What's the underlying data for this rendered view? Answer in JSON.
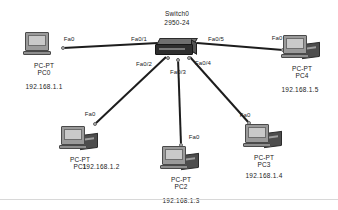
{
  "diagram": {
    "type": "network-topology",
    "tool": "packet-tracer",
    "switch": {
      "name": "Switch0",
      "model": "2950-24",
      "x": 177,
      "y": 47
    },
    "devices": [
      {
        "id": "pc0",
        "type": "PC-PT",
        "name": "PC0",
        "ip": "192.168.1.1",
        "port": "Fa0",
        "switch_port": "Fa0/1",
        "x": 44,
        "y": 46,
        "icon": "pc-icon"
      },
      {
        "id": "pc1",
        "type": "PC-PT",
        "name": "PC1",
        "ip": "192.168.1.2",
        "port": "Fa0",
        "switch_port": "Fa0/2",
        "x": 80,
        "y": 140,
        "icon": "pc-icon"
      },
      {
        "id": "pc2",
        "type": "PC-PT",
        "name": "PC2",
        "ip": "192.168.1.3",
        "port": "Fa0",
        "switch_port": "Fa0/3",
        "x": 181,
        "y": 160,
        "icon": "pc-icon"
      },
      {
        "id": "pc3",
        "type": "PC-PT",
        "name": "PC3",
        "ip": "192.168.1.4",
        "port": "Fa0",
        "switch_port": "Fa0/4",
        "x": 264,
        "y": 138,
        "icon": "pc-icon"
      },
      {
        "id": "pc4",
        "type": "PC-PT",
        "name": "PC4",
        "ip": "192.168.1.5",
        "port": "Fa0",
        "switch_port": "Fa0/5",
        "x": 302,
        "y": 49,
        "icon": "pc-icon"
      }
    ],
    "links": [
      {
        "id": "link-pc0",
        "from": "pc0",
        "to": "switch",
        "x1": 63,
        "y1": 48,
        "x2": 158,
        "y2": 43,
        "switch_port": "Fa0/1",
        "device_port": "Fa0",
        "port_label_x": 139,
        "port_label_y": 39,
        "device_label_x": 69,
        "device_label_y": 39
      },
      {
        "id": "link-pc1",
        "from": "pc1",
        "to": "switch",
        "x1": 95,
        "y1": 124,
        "x2": 166,
        "y2": 57,
        "switch_port": "Fa0/2",
        "device_port": "Fa0",
        "port_label_x": 144,
        "port_label_y": 64,
        "device_label_x": 90,
        "device_label_y": 114
      },
      {
        "id": "link-pc2",
        "from": "pc2",
        "to": "switch",
        "x1": 181,
        "y1": 145,
        "x2": 178,
        "y2": 58,
        "switch_port": "Fa0/3",
        "device_port": "Fa0",
        "port_label_x": 178,
        "port_label_y": 72,
        "device_label_x": 194,
        "device_label_y": 137
      },
      {
        "id": "link-pc3",
        "from": "pc3",
        "to": "switch",
        "x1": 249,
        "y1": 123,
        "x2": 190,
        "y2": 57,
        "switch_port": "Fa0/4",
        "device_port": "Fa0",
        "port_label_x": 203,
        "port_label_y": 63,
        "device_label_x": 245,
        "device_label_y": 115
      },
      {
        "id": "link-pc4",
        "from": "pc4",
        "to": "switch",
        "x1": 283,
        "y1": 50,
        "x2": 197,
        "y2": 43,
        "switch_port": "Fa0/5",
        "device_port": "Fa0",
        "port_label_x": 216,
        "port_label_y": 39,
        "device_label_x": 277,
        "device_label_y": 38
      }
    ],
    "colors": {
      "link": "#1d1d1d",
      "text": "#1b1b1b",
      "background": "#ffffff",
      "switch_body": "#2e2e2e",
      "pc_monitor": "#9a9a9a"
    }
  }
}
